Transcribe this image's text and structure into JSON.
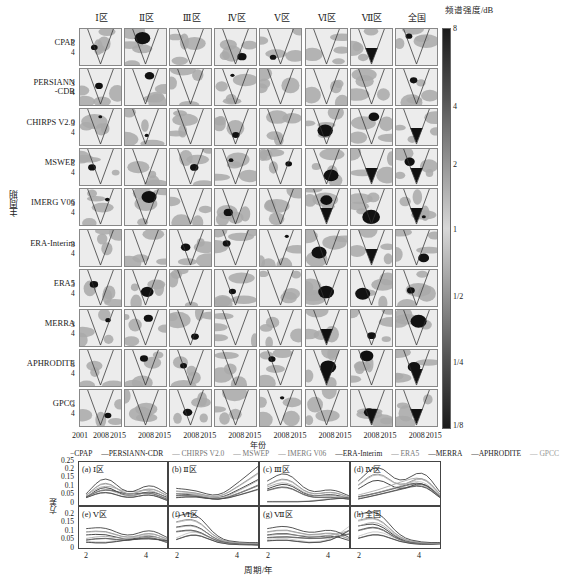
{
  "chart_data": [
    {
      "type": "heatmap",
      "title": "Wavelet power spectrum grid",
      "columns": [
        "Ⅰ区",
        "Ⅱ区",
        "Ⅲ区",
        "Ⅳ区",
        "Ⅴ区",
        "Ⅵ区",
        "Ⅶ区",
        "全国"
      ],
      "rows": [
        "CPAP",
        "PERSIANN\n-CDR",
        "CHIRPS V2.0",
        "MSWEP",
        "IMERG V06",
        "ERA-Interim",
        "ERA5",
        "MERRA",
        "APHRODITE",
        "GPCC"
      ],
      "ylabel": "主周期",
      "ytick_labels": [
        "3",
        "4"
      ],
      "xlabel": "年份",
      "xtick_labels_first": [
        "2001",
        "2008",
        "2015"
      ],
      "xtick_labels_other": [
        "2008",
        "2015"
      ],
      "colorbar": {
        "title": "频谱强度/dB",
        "ticks": [
          "8",
          "4",
          "2",
          "1",
          "1/2",
          "1/4",
          "1/8"
        ],
        "scale": "log2"
      }
    },
    {
      "type": "line",
      "xlabel": "周期/年",
      "ylabel": "方差",
      "ylim": [
        0,
        0.25
      ],
      "yticks": [
        "0.25",
        "0.2",
        "0.15",
        "0.1",
        "0.05",
        "0"
      ],
      "xticks": [
        "2",
        "4"
      ],
      "xlim": [
        1.8,
        4.8
      ],
      "legend": [
        "CPAP",
        "PERSIANN-CDR",
        "CHIRPS V2.0",
        "MSWEP",
        "IMERG V06",
        "ERA-Interim",
        "ERA5",
        "MERRA",
        "APHRODITE",
        "GPCC"
      ],
      "legend_position": "top",
      "panels": [
        {
          "label": "(a) Ⅰ区",
          "peak_period": [
            2.6,
            4.0
          ],
          "peak_var": [
            0.16,
            0.11
          ]
        },
        {
          "label": "(b) Ⅱ区",
          "peak_period": [
            2.2,
            4.3
          ],
          "peak_var": [
            0.09,
            0.2
          ]
        },
        {
          "label": "(c) Ⅲ区",
          "peak_period": [
            2.5,
            4.3
          ],
          "peak_var": [
            0.18,
            0.08
          ]
        },
        {
          "label": "(d) Ⅳ区",
          "peak_period": [
            2.7,
            3.7
          ],
          "peak_var": [
            0.22,
            0.19
          ]
        },
        {
          "label": "(e) Ⅴ区",
          "peak_period": [
            2.3,
            4.0
          ],
          "peak_var": [
            0.11,
            0.1
          ]
        },
        {
          "label": "(f) Ⅵ区",
          "peak_period": [
            2.5,
            4.3
          ],
          "peak_var": [
            0.2,
            0.03
          ]
        },
        {
          "label": "(g) Ⅶ区",
          "peak_period": [
            2.3,
            3.7
          ],
          "peak_var": [
            0.12,
            0.1
          ]
        },
        {
          "label": "(h) 全国",
          "peak_period": [
            2.5,
            4.4
          ],
          "peak_var": [
            0.21,
            0.02
          ]
        }
      ]
    }
  ],
  "labels": {
    "col0": "Ⅰ区",
    "col1": "Ⅱ区",
    "col2": "Ⅲ区",
    "col3": "Ⅳ区",
    "col4": "Ⅴ区",
    "col5": "Ⅵ区",
    "col6": "Ⅶ区",
    "col7": "全国",
    "row0": "CPAP",
    "row1": "PERSIANN\n-CDR",
    "row2": "CHIRPS V2.0",
    "row3": "MSWEP",
    "row4": "IMERG V06",
    "row5": "ERA-Interim",
    "row6": "ERA5",
    "row7": "MERRA",
    "row8": "APHRODITE",
    "row9": "GPCC",
    "tick3": "3",
    "tick4": "4",
    "ylabel_heat": "主周期",
    "xlabel_heat": "年份",
    "x2001": "2001",
    "x2008": "2008",
    "x2015": "2015",
    "cbtitle": "频谱强度/dB",
    "cb8": "8",
    "cb4": "4",
    "cb2": "2",
    "cb1": "1",
    "cbh": "1/2",
    "cbq": "1/4",
    "cbe": "1/8",
    "leg0": "−CPAP",
    "leg1": "—PERSIANN-CDR",
    "leg2": "— CHIRPS V2.0",
    "leg3": "— MSWEP",
    "leg4": "— IMERG V06",
    "leg5": "—ERA-Interim",
    "leg6": "— ERA5",
    "leg7": "—MERRA",
    "leg8": "—APHRODITE",
    "leg9": "— GPCC",
    "pa": "(a) Ⅰ区",
    "pb": "(b) Ⅱ区",
    "pc": "(c) Ⅲ区",
    "pd": "(d) Ⅳ区",
    "pe": "(e) Ⅴ区",
    "pf": "(f) Ⅵ区",
    "pg": "(g) Ⅶ区",
    "ph": "(h) 全国",
    "y025": "0.25",
    "y02": "0.2",
    "y015": "0.15",
    "y01": "0.1",
    "y005": "0.05",
    "y0": "0",
    "x2": "2",
    "x4": "4",
    "ylabel_line": "方差",
    "xlabel_line": "周期/年"
  }
}
